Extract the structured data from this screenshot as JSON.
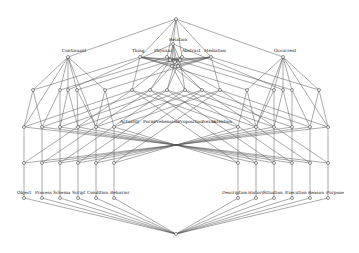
{
  "diagram": {
    "type": "concept-lattice",
    "top_labels": [
      "Continuant",
      "Thing",
      "Physical",
      "Relation",
      "Abstract",
      "Mediation",
      "Occurrent"
    ],
    "middle_labels": [
      "Actuality",
      "Form",
      "Prehension",
      "Proposition",
      "Nexus",
      "Intention"
    ],
    "bottom_left_labels": [
      "Object",
      "Process",
      "Schema",
      "Script",
      "Condition",
      "Behavior"
    ],
    "bottom_right_labels": [
      "Description",
      "History",
      "Situation",
      "Execution",
      "Reason",
      "Purpose"
    ],
    "colors": {
      "line": "#555555",
      "node_fill": "#ffffff",
      "node_stroke": "#444444",
      "text": "#222222"
    }
  }
}
